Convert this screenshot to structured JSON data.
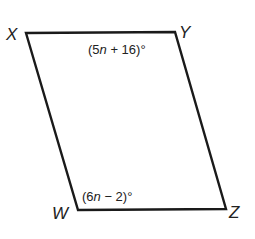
{
  "figure": {
    "type": "parallelogram",
    "vertices": [
      {
        "name": "X",
        "label": "X",
        "x": 26,
        "y": 33
      },
      {
        "name": "Y",
        "label": "Y",
        "x": 175,
        "y": 32
      },
      {
        "name": "Z",
        "label": "Z",
        "x": 226,
        "y": 209
      },
      {
        "name": "W",
        "label": "W",
        "x": 78,
        "y": 210
      }
    ],
    "angles": {
      "Y": {
        "expr_prefix": "(5",
        "var": "n",
        "expr_suffix": " + 16)°"
      },
      "W": {
        "expr_prefix": "(6",
        "var": "n",
        "expr_suffix": " − 2)°"
      }
    },
    "colors": {
      "stroke": "#1a1a1a",
      "text": "#222222",
      "background": "#ffffff"
    }
  }
}
